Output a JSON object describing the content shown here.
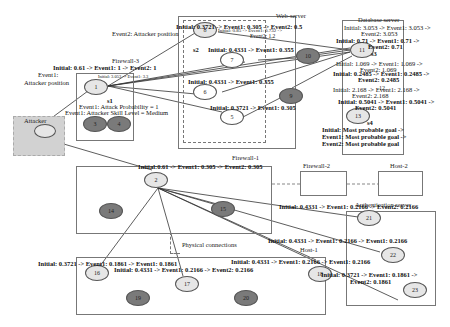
{
  "diagram": {
    "zones": {
      "firewall_3": "Firewall-3",
      "web_server": "Web-server",
      "database_server": "Database server",
      "firewall_1": "Firewall-1",
      "firewall_2": "Firewall-2",
      "host_2": "Host-2",
      "authentication_server": "Authentication server",
      "host_1": "Host-1",
      "physical_connections": "Physical connections",
      "attacker": "Attacker"
    },
    "nodes": [
      {
        "id": "1"
      },
      {
        "id": "2"
      },
      {
        "id": "3"
      },
      {
        "id": "4"
      },
      {
        "id": "5"
      },
      {
        "id": "6"
      },
      {
        "id": "7"
      },
      {
        "id": "8"
      },
      {
        "id": "9"
      },
      {
        "id": "10"
      },
      {
        "id": "11"
      },
      {
        "id": "12"
      },
      {
        "id": "13"
      },
      {
        "id": "14"
      },
      {
        "id": "15"
      },
      {
        "id": "16"
      },
      {
        "id": "17"
      },
      {
        "id": "18"
      },
      {
        "id": "19"
      },
      {
        "id": "20"
      },
      {
        "id": "21"
      },
      {
        "id": "22"
      },
      {
        "id": "23"
      }
    ],
    "state_labels": {
      "s1": "s1",
      "s2": "s2",
      "s3": "s3",
      "s4": "s4"
    },
    "annotations": {
      "event1_attacker_position": "Event1:",
      "event1_attacker_position_2": "Attacker position",
      "event2_attacker_position": "Event2: Attacker position",
      "node1_prob": "Initial: 0.61 -> Event1: 1 -> Event2: 1",
      "node1_small": "Initial: 3.053 -> Event1: 3.3",
      "attack_probability": "Event1: Attack Probability = 1",
      "attacker_skill": "Event1: Attacker Skill Level = Medium",
      "node8_prob": "Initial: 0.3721 -> Event1: 0.305 -> Event2: 0.5",
      "node8_small": "Initial: 0.85 -> Event1: 0.732 ->",
      "node8_small_2": "Event2: 1.2",
      "node7_prob": "Initial: 0.4331 -> Event1: 0.355",
      "node6_prob": "Initial: 0.4331 -> Event1: 0.355",
      "node5_prob": "Initial: 0.3721 -> Event1: 0.305",
      "db_line1": "Initial: 3.053 -> Event1: 3.053 ->",
      "db_line2": "Event2: 3.053",
      "node11_prob_1": "Initial: 0.71 -> Event1: 0.71 ->",
      "node11_prob_2": "Event2: 0.71",
      "db_line3": "Initial: 1.069 -> Event1: 1.069 ->",
      "db_line4": "Event2: 1.069",
      "node12_prob_1": "Initial: 0.2485 -> Event1: 0.2485 ->",
      "node12_prob_2": "Event2: 0.2485",
      "db_line5": "Initial: 2.168 -> Event1: 2.168 ->",
      "db_line6": "Event2: 2.168",
      "node13_prob_1": "Initial: 0.5041 -> Event1: 0.5041 ->",
      "node13_prob_2": "Event2: 0.5041",
      "goal_1": "Initial: Most probable goal ->",
      "goal_2": "Event1: Most probable goal ->",
      "goal_3": "Event2: Most probable goal",
      "node2_prob": "Initial:0.61 -> Event1: 0.305 -> Event2: 0.305",
      "node21_prob": "Initial: 0.4331 -> Event1: 0.2166 -> Event2: 0.2166",
      "node22_prob": "Initial: 0.4331 -> Event1: 0.2166 -> Event1: 0.2166",
      "node18_prob": "Initial: 0.4331 -> Event1: 0.2166 -> Event1: 0.2166",
      "node23_prob_1": "Initial: 0.3721 -> Event1: 0.1861 ->",
      "node23_prob_2": "Event2: 0.1861",
      "node16_prob": "Initial: 0.3721 -> Event1: 0.1861 -> Event1: 0.1861",
      "node17_prob": "Initial: 0.4331 -> Event1: 0.2166 -> Event2: 0.2166"
    }
  }
}
